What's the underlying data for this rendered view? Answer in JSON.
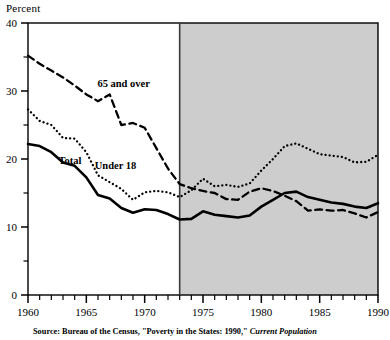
{
  "chart_data": {
    "type": "line",
    "title": "",
    "ylabel": "Percent",
    "xlabel": "",
    "ylim": [
      0,
      40
    ],
    "xlim": [
      1960,
      1990
    ],
    "ytick_labels": [
      "0",
      "10",
      "20",
      "30",
      "40"
    ],
    "ytick_values": [
      0,
      10,
      20,
      30,
      40
    ],
    "yminor_step": 5,
    "xtick_labels": [
      "1960",
      "1965",
      "1970",
      "1975",
      "1980",
      "1985",
      "1990"
    ],
    "xtick_values": [
      1960,
      1965,
      1970,
      1975,
      1980,
      1985,
      1990
    ],
    "xminor_step": 1,
    "grid": false,
    "legend_position": "inline-annotations",
    "shaded_region": {
      "from": 1973,
      "to": 1990,
      "color": "#cdcdcd",
      "label": ""
    },
    "x": [
      1960,
      1961,
      1962,
      1963,
      1964,
      1965,
      1966,
      1967,
      1968,
      1969,
      1970,
      1971,
      1972,
      1973,
      1974,
      1975,
      1976,
      1977,
      1978,
      1979,
      1980,
      1981,
      1982,
      1983,
      1984,
      1985,
      1986,
      1987,
      1988,
      1989,
      1990
    ],
    "series": [
      {
        "name": "65 and over",
        "style": "dashed",
        "color": "#000000",
        "label_x": 1968.2,
        "label_y": 30.6,
        "values": [
          35.2,
          34.0,
          33.0,
          32.0,
          30.8,
          29.5,
          28.5,
          29.5,
          25.0,
          25.3,
          24.6,
          21.6,
          18.6,
          16.3,
          15.7,
          15.3,
          15.0,
          14.1,
          14.0,
          15.2,
          15.7,
          15.3,
          14.6,
          13.8,
          12.4,
          12.6,
          12.4,
          12.5,
          12.0,
          11.4,
          12.2
        ]
      },
      {
        "name": "Under 18",
        "style": "dotted",
        "color": "#000000",
        "label_x": 1967.5,
        "label_y": 18.6,
        "values": [
          27.3,
          25.6,
          25.0,
          23.1,
          23.0,
          21.0,
          17.6,
          16.6,
          15.6,
          14.0,
          15.1,
          15.3,
          15.1,
          14.4,
          15.4,
          17.1,
          16.0,
          16.2,
          15.9,
          16.4,
          18.3,
          20.0,
          21.9,
          22.3,
          21.5,
          20.7,
          20.5,
          20.3,
          19.5,
          19.6,
          20.6
        ]
      },
      {
        "name": "Total",
        "style": "solid",
        "color": "#000000",
        "label_x": 1963.6,
        "label_y": 19.3,
        "values": [
          22.2,
          21.9,
          21.0,
          19.5,
          19.0,
          17.3,
          14.7,
          14.2,
          12.8,
          12.1,
          12.6,
          12.5,
          11.9,
          11.1,
          11.2,
          12.3,
          11.8,
          11.6,
          11.4,
          11.7,
          13.0,
          14.0,
          15.0,
          15.2,
          14.4,
          14.0,
          13.6,
          13.4,
          13.0,
          12.8,
          13.5
        ]
      }
    ]
  },
  "source": {
    "prefix": "Source: Bureau of the Census, \"Poverty in the States: 1990,\" ",
    "italic": "Current Population"
  }
}
